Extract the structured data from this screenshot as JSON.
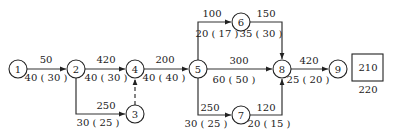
{
  "diagram": {
    "type": "network-graph",
    "nodes": [
      {
        "id": "1",
        "x": 18,
        "y": 69
      },
      {
        "id": "2",
        "x": 76,
        "y": 69
      },
      {
        "id": "3",
        "x": 135,
        "y": 114
      },
      {
        "id": "4",
        "x": 135,
        "y": 69
      },
      {
        "id": "5",
        "x": 198,
        "y": 69
      },
      {
        "id": "6",
        "x": 241,
        "y": 22
      },
      {
        "id": "7",
        "x": 241,
        "y": 115
      },
      {
        "id": "8",
        "x": 282,
        "y": 69
      },
      {
        "id": "9",
        "x": 338,
        "y": 69
      }
    ],
    "edges": [
      {
        "from": "1",
        "to": "2",
        "top": "50",
        "bottom": "40 ( 30 )",
        "style": "solid"
      },
      {
        "from": "2",
        "to": "4",
        "top": "420",
        "bottom": "40 ( 30 )",
        "style": "solid"
      },
      {
        "from": "2",
        "to": "3",
        "top": "250",
        "bottom": "30 ( 25 )",
        "style": "solid"
      },
      {
        "from": "3",
        "to": "4",
        "top": "",
        "bottom": "",
        "style": "dashed"
      },
      {
        "from": "4",
        "to": "5",
        "top": "200",
        "bottom": "40 ( 40 )",
        "style": "solid"
      },
      {
        "from": "5",
        "to": "6",
        "top": "100",
        "bottom": "20 ( 17 )",
        "style": "solid"
      },
      {
        "from": "6",
        "to": "8",
        "top": "150",
        "bottom": "35 ( 30 )",
        "style": "solid"
      },
      {
        "from": "5",
        "to": "8",
        "top": "300",
        "bottom": "60 ( 50 )",
        "style": "solid"
      },
      {
        "from": "5",
        "to": "7",
        "top": "250",
        "bottom": "30 ( 25 )",
        "style": "solid"
      },
      {
        "from": "7",
        "to": "8",
        "top": "120",
        "bottom": "20 ( 15 )",
        "style": "solid"
      },
      {
        "from": "8",
        "to": "9",
        "top": "420",
        "bottom": "25 ( 20 )",
        "style": "solid"
      }
    ],
    "result_box": {
      "inside": "210",
      "below": "220"
    }
  }
}
